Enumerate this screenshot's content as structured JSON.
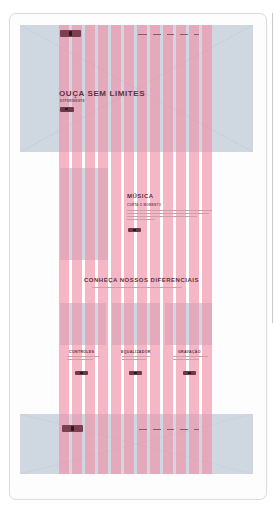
{
  "header": {
    "logo_label": "LOGO",
    "nav_items": [
      "INÍCIO",
      "MÚSICA",
      "CONTATO",
      "SOBRE",
      "LOJA"
    ]
  },
  "hero": {
    "title": "OUÇA SEM LIMITES",
    "subtitle": "EXPERIMENTE",
    "button_label": "VER"
  },
  "music": {
    "title": "MÚSICA",
    "subtitle": "CURTA O MOMENTO",
    "body_lines": 4,
    "button_label": "VER"
  },
  "features": {
    "title": "CONHEÇA NOSSOS DIFERENCIAIS",
    "cards": [
      {
        "title": "CONTROLES",
        "button_label": "VER"
      },
      {
        "title": "EQUALIZADOR",
        "button_label": "VER"
      },
      {
        "title": "GRAVAÇÃO",
        "button_label": "VER"
      }
    ]
  },
  "footer": {
    "logo_label": "LOGO",
    "nav_items": [
      "INÍCIO",
      "MÚSICA",
      "CONTATO",
      "SOBRE",
      "LOJA"
    ]
  },
  "grid": {
    "columns": 12,
    "column_color": "#f08ca5",
    "placeholder_color": "#cfd8e0",
    "accent_color": "#7a3f50"
  }
}
